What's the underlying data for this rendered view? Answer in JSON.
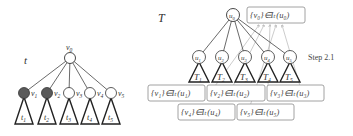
{
  "left_tree": {
    "title": "t",
    "root": {
      "label": "v",
      "sub": "0"
    },
    "children": [
      {
        "label": "v",
        "sub": "1",
        "filled": true,
        "subtree": "t",
        "subtree_sub": "1"
      },
      {
        "label": "v",
        "sub": "2",
        "filled": true,
        "subtree": "t",
        "subtree_sub": "2"
      },
      {
        "label": "v",
        "sub": "3",
        "filled": false,
        "subtree": "t",
        "subtree_sub": "3"
      },
      {
        "label": "v",
        "sub": "4",
        "filled": false,
        "subtree": "t",
        "subtree_sub": "4"
      },
      {
        "label": "v",
        "sub": "5",
        "filled": false,
        "subtree": "t",
        "subtree_sub": "5"
      }
    ]
  },
  "right_tree": {
    "title": "T",
    "root": {
      "label": "u",
      "sub": "0"
    },
    "root_box": "{v₀}∈Iₜ(u₀)",
    "children": [
      {
        "label": "u",
        "sub": "1",
        "subtree": "T",
        "subtree_sub": "1"
      },
      {
        "label": "u",
        "sub": "2",
        "subtree": "T",
        "subtree_sub": "2"
      },
      {
        "label": "u",
        "sub": "3",
        "subtree": "T",
        "subtree_sub": "3"
      },
      {
        "label": "u",
        "sub": "4",
        "subtree": "T",
        "subtree_sub": "4"
      },
      {
        "label": "u",
        "sub": "5",
        "subtree": "T",
        "subtree_sub": "5"
      }
    ],
    "boxes_row1": [
      "{v₁}∈Iₜ(u₁)",
      "{v₂}∈Iₜ(u₂)",
      "{v₃}∈Iₜ(u₃)"
    ],
    "boxes_row2": [
      "{v₄}∈Iₜ(u₄)",
      "{v₅}∈Iₜ(u₅)"
    ]
  },
  "step_label": "Step 2.1",
  "colors": {
    "line": "#333333",
    "filled_node": "#5a5a5a",
    "box_border": "#8a8a8a",
    "arrow": "#999999"
  }
}
